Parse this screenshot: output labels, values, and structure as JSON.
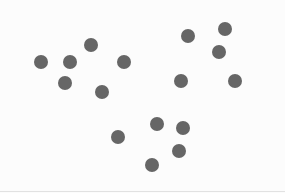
{
  "chart_data": {
    "type": "scatter",
    "title": "",
    "xlabel": "",
    "ylabel": "",
    "grid": false,
    "axes_visible": false,
    "legend": null,
    "xlim": [
      0,
      285
    ],
    "ylim": [
      193,
      0
    ],
    "point_color": "#666666",
    "point_radius": 7,
    "series": [
      {
        "name": "cluster-1",
        "points": [
          {
            "x": 41,
            "y": 62
          },
          {
            "x": 70,
            "y": 62
          },
          {
            "x": 91,
            "y": 45
          },
          {
            "x": 124,
            "y": 62
          },
          {
            "x": 65,
            "y": 83
          },
          {
            "x": 102,
            "y": 92
          }
        ]
      },
      {
        "name": "cluster-2",
        "points": [
          {
            "x": 188,
            "y": 36
          },
          {
            "x": 225,
            "y": 29
          },
          {
            "x": 219,
            "y": 52
          },
          {
            "x": 181,
            "y": 81
          },
          {
            "x": 235,
            "y": 81
          }
        ]
      },
      {
        "name": "cluster-3",
        "points": [
          {
            "x": 157,
            "y": 124
          },
          {
            "x": 183,
            "y": 128
          },
          {
            "x": 118,
            "y": 137
          },
          {
            "x": 179,
            "y": 151
          },
          {
            "x": 152,
            "y": 165
          }
        ]
      }
    ]
  },
  "colors": {
    "background": "#fcfcfc",
    "point": "#666666",
    "bottom_edge": "#e2e2e2"
  }
}
